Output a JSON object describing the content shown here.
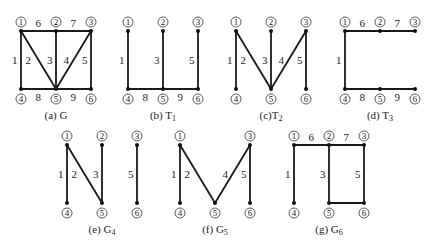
{
  "node_ids": [
    "1",
    "2",
    "3",
    "4",
    "5",
    "6"
  ],
  "colors": {
    "edge": "#1a1a1a",
    "node": "#111111",
    "text": "#222222"
  },
  "panels": [
    {
      "id": "a",
      "caption": "(a) G",
      "caption_main": "(a) G",
      "caption_sub": "",
      "origin": [
        21,
        31
      ],
      "edges": [
        {
          "from": "1",
          "to": "4",
          "label": "1"
        },
        {
          "from": "1",
          "to": "5",
          "label": "2"
        },
        {
          "from": "2",
          "to": "5",
          "label": "3"
        },
        {
          "from": "3",
          "to": "5",
          "label": "4"
        },
        {
          "from": "3",
          "to": "6",
          "label": "5"
        },
        {
          "from": "1",
          "to": "2",
          "label": "6"
        },
        {
          "from": "2",
          "to": "3",
          "label": "7"
        },
        {
          "from": "4",
          "to": "5",
          "label": "8"
        },
        {
          "from": "5",
          "to": "6",
          "label": "9"
        }
      ],
      "visible_nodes": [
        "1",
        "2",
        "3",
        "4",
        "5",
        "6"
      ]
    },
    {
      "id": "b",
      "caption": "(b) T1",
      "caption_main": "(b) T",
      "caption_sub": "1",
      "origin": [
        128,
        31
      ],
      "edges": [
        {
          "from": "1",
          "to": "4",
          "label": "1"
        },
        {
          "from": "2",
          "to": "5",
          "label": "3"
        },
        {
          "from": "3",
          "to": "6",
          "label": "5"
        },
        {
          "from": "4",
          "to": "5",
          "label": "8"
        },
        {
          "from": "5",
          "to": "6",
          "label": "9"
        }
      ],
      "visible_nodes": [
        "1",
        "2",
        "3",
        "4",
        "5",
        "6"
      ]
    },
    {
      "id": "c",
      "caption": "(c)T2",
      "caption_main": "(c)T",
      "caption_sub": "2",
      "origin": [
        236,
        31
      ],
      "edges": [
        {
          "from": "1",
          "to": "4",
          "label": "1"
        },
        {
          "from": "1",
          "to": "5",
          "label": "2"
        },
        {
          "from": "2",
          "to": "5",
          "label": "3"
        },
        {
          "from": "3",
          "to": "5",
          "label": "4"
        },
        {
          "from": "3",
          "to": "6",
          "label": "5"
        }
      ],
      "visible_nodes": [
        "1",
        "2",
        "3",
        "4",
        "5",
        "6"
      ]
    },
    {
      "id": "d",
      "caption": "(d) T3",
      "caption_main": "(d) T",
      "caption_sub": "3",
      "origin": [
        345,
        31
      ],
      "edges": [
        {
          "from": "1",
          "to": "4",
          "label": "1"
        },
        {
          "from": "1",
          "to": "2",
          "label": "6"
        },
        {
          "from": "2",
          "to": "3",
          "label": "7"
        },
        {
          "from": "4",
          "to": "5",
          "label": "8"
        },
        {
          "from": "5",
          "to": "6",
          "label": "9"
        }
      ],
      "visible_nodes": [
        "1",
        "2",
        "3",
        "4",
        "5",
        "6"
      ]
    },
    {
      "id": "e",
      "caption": "(e) G4",
      "caption_main": "(e) G",
      "caption_sub": "4",
      "origin": [
        67,
        145
      ],
      "edges": [
        {
          "from": "1",
          "to": "4",
          "label": "1"
        },
        {
          "from": "1",
          "to": "5",
          "label": "2"
        },
        {
          "from": "2",
          "to": "5",
          "label": "3"
        },
        {
          "from": "3",
          "to": "6",
          "label": "5"
        }
      ],
      "visible_nodes": [
        "1",
        "2",
        "3",
        "4",
        "5",
        "6"
      ]
    },
    {
      "id": "f",
      "caption": "(f) G5",
      "caption_main": "(f) G",
      "caption_sub": "5",
      "origin": [
        180,
        145
      ],
      "edges": [
        {
          "from": "1",
          "to": "4",
          "label": "1"
        },
        {
          "from": "1",
          "to": "5",
          "label": "2"
        },
        {
          "from": "3",
          "to": "5",
          "label": "4"
        },
        {
          "from": "3",
          "to": "6",
          "label": "5"
        }
      ],
      "visible_nodes": [
        "1",
        "3",
        "4",
        "5",
        "6"
      ]
    },
    {
      "id": "g",
      "caption": "(g) G6",
      "caption_main": "(g) G",
      "caption_sub": "6",
      "origin": [
        294,
        145
      ],
      "edges": [
        {
          "from": "1",
          "to": "4",
          "label": "1"
        },
        {
          "from": "2",
          "to": "5",
          "label": "3"
        },
        {
          "from": "3",
          "to": "6",
          "label": "5"
        },
        {
          "from": "1",
          "to": "2",
          "label": "6"
        },
        {
          "from": "2",
          "to": "3",
          "label": "7"
        },
        {
          "from": "5",
          "to": "6",
          "label": "",
          "note": "unlabeled edge between 5 and 6"
        }
      ],
      "visible_nodes": [
        "1",
        "2",
        "3",
        "4",
        "5",
        "6"
      ]
    }
  ]
}
